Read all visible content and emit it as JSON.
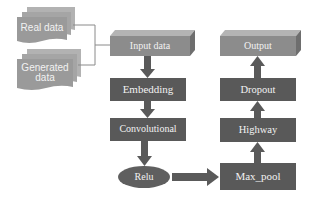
{
  "diagram": {
    "type": "flowchart",
    "inputs": [
      {
        "id": "real",
        "label": "Real data",
        "shape": "multi-document"
      },
      {
        "id": "generated",
        "label": "Generated data",
        "label_lines": [
          "Generated",
          "data"
        ],
        "shape": "multi-document"
      }
    ],
    "nodes": [
      {
        "id": "input_data",
        "label": "Input data",
        "shape": "3d-box"
      },
      {
        "id": "embedding",
        "label": "Embedding",
        "shape": "rect"
      },
      {
        "id": "convolutional",
        "label": "Convolutional",
        "shape": "rect"
      },
      {
        "id": "relu",
        "label": "Relu",
        "shape": "ellipse"
      },
      {
        "id": "max_pool",
        "label": "Max_pool",
        "shape": "rect"
      },
      {
        "id": "highway",
        "label": "Highway",
        "shape": "rect"
      },
      {
        "id": "dropout",
        "label": "Dropout",
        "shape": "rect"
      },
      {
        "id": "output",
        "label": "Output",
        "shape": "3d-box"
      }
    ],
    "edges": [
      {
        "from": "real",
        "to": "input_data",
        "style": "thin-line"
      },
      {
        "from": "generated",
        "to": "input_data",
        "style": "thin-line"
      },
      {
        "from": "input_data",
        "to": "embedding",
        "style": "block-arrow"
      },
      {
        "from": "embedding",
        "to": "convolutional",
        "style": "block-arrow"
      },
      {
        "from": "convolutional",
        "to": "relu",
        "style": "block-arrow"
      },
      {
        "from": "relu",
        "to": "max_pool",
        "style": "block-arrow"
      },
      {
        "from": "max_pool",
        "to": "highway",
        "style": "block-arrow"
      },
      {
        "from": "highway",
        "to": "dropout",
        "style": "block-arrow"
      },
      {
        "from": "dropout",
        "to": "output",
        "style": "block-arrow"
      }
    ],
    "colors": {
      "document_fill": "#9a9a9a",
      "box3d_fill": "#8c8c8c",
      "box3d_top": "#b4b4b4",
      "box3d_side": "#6e6e6e",
      "dark_box_fill": "#595959",
      "arrow_fill": "#5a5a5a",
      "connector_line": "#8a8a8a",
      "text": "#f2f2f2"
    }
  }
}
